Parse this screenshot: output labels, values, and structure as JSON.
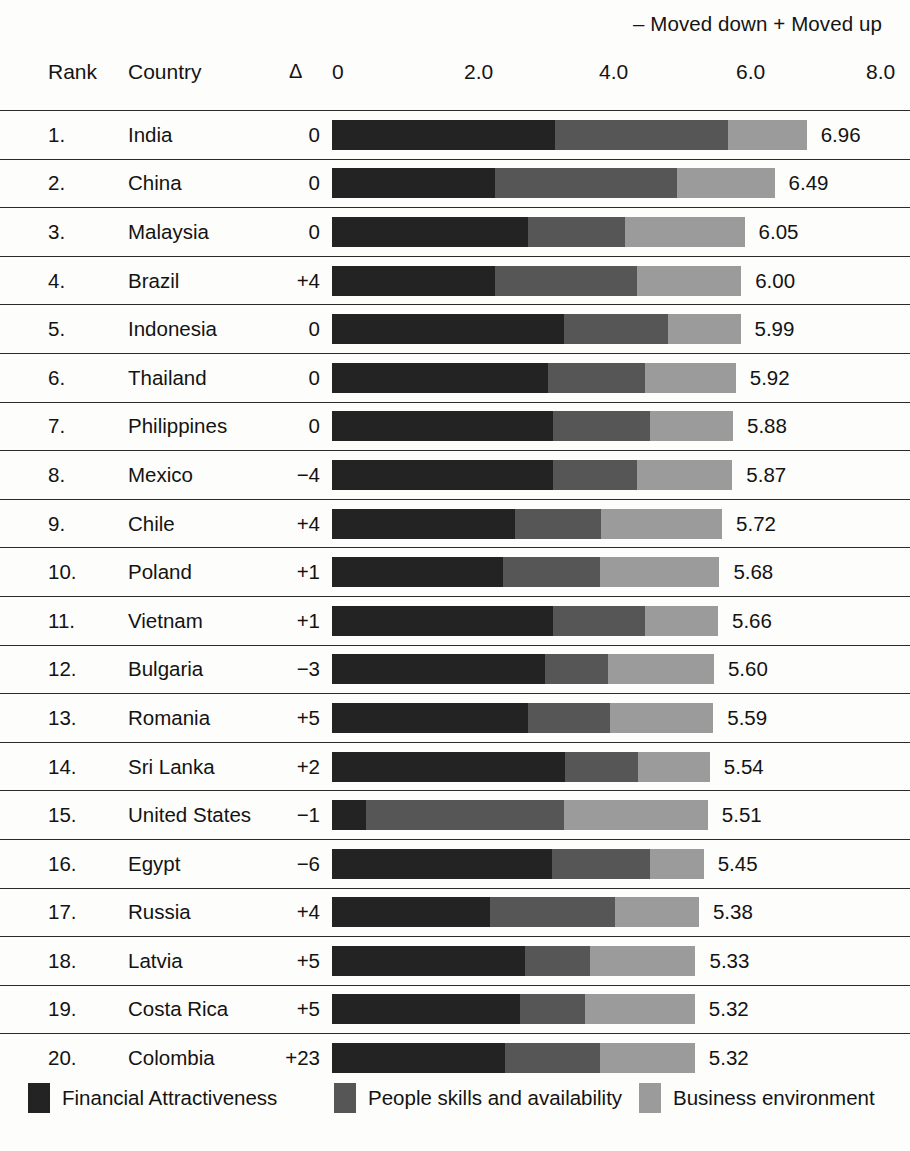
{
  "move_legend": {
    "down_symbol": "–",
    "down_label": "Moved down",
    "up_symbol": "+",
    "up_label": "Moved up",
    "full": "– Moved down + Moved up"
  },
  "columns": {
    "rank": "Rank",
    "country": "Country",
    "delta": "Δ"
  },
  "axis": {
    "ticks": [
      "0",
      "2.0",
      "4.0",
      "6.0",
      "8.0"
    ],
    "min": 0,
    "max": 8,
    "px_per_unit": 68.2,
    "origin_px": 332
  },
  "legend": [
    {
      "label": "Financial Attractiveness",
      "color": "#232323",
      "key": "financial"
    },
    {
      "label": "People skills and availability",
      "color": "#565656",
      "key": "people"
    },
    {
      "label": "Business environment",
      "color": "#9b9b9b",
      "key": "business"
    }
  ],
  "chart_data": {
    "type": "bar",
    "orientation": "horizontal",
    "stacked": true,
    "title": "",
    "xlabel": "",
    "ylabel": "",
    "xlim": [
      0,
      8
    ],
    "xticks": [
      0,
      2,
      4,
      6,
      8
    ],
    "grid": false,
    "legend_position": "bottom",
    "categories": [
      "India",
      "China",
      "Malaysia",
      "Brazil",
      "Indonesia",
      "Thailand",
      "Philippines",
      "Mexico",
      "Chile",
      "Poland",
      "Vietnam",
      "Bulgaria",
      "Romania",
      "Sri Lanka",
      "United States",
      "Egypt",
      "Russia",
      "Latvia",
      "Costa Rica",
      "Colombia"
    ],
    "series": [
      {
        "name": "Financial Attractiveness",
        "color": "#232323",
        "values": [
          3.27,
          2.39,
          2.87,
          2.39,
          3.4,
          3.17,
          3.24,
          3.24,
          2.68,
          2.51,
          3.24,
          3.12,
          2.87,
          3.42,
          0.5,
          3.23,
          2.32,
          2.83,
          2.76,
          2.54
        ]
      },
      {
        "name": "People skills and availability",
        "color": "#565656",
        "values": [
          2.54,
          2.67,
          1.42,
          2.08,
          1.52,
          1.42,
          1.42,
          1.23,
          1.26,
          1.42,
          1.35,
          0.92,
          1.2,
          1.07,
          2.9,
          1.44,
          1.83,
          0.95,
          0.95,
          1.39
        ]
      },
      {
        "name": "Business environment",
        "color": "#9b9b9b",
        "values": [
          1.15,
          1.43,
          1.76,
          1.53,
          1.07,
          1.33,
          1.22,
          1.4,
          1.78,
          1.75,
          1.07,
          1.56,
          1.52,
          1.05,
          2.11,
          0.78,
          1.23,
          1.55,
          1.61,
          1.39
        ]
      }
    ],
    "totals": [
      6.96,
      6.49,
      6.05,
      6.0,
      5.99,
      5.92,
      5.88,
      5.87,
      5.72,
      5.68,
      5.66,
      5.6,
      5.59,
      5.54,
      5.51,
      5.45,
      5.38,
      5.33,
      5.32,
      5.32
    ]
  },
  "rows": [
    {
      "rank": "1.",
      "country": "India",
      "delta": "0",
      "score": "6.96",
      "fin": 3.27,
      "peo": 2.54,
      "biz": 1.15
    },
    {
      "rank": "2.",
      "country": "China",
      "delta": "0",
      "score": "6.49",
      "fin": 2.39,
      "peo": 2.67,
      "biz": 1.43
    },
    {
      "rank": "3.",
      "country": "Malaysia",
      "delta": "0",
      "score": "6.05",
      "fin": 2.87,
      "peo": 1.42,
      "biz": 1.76
    },
    {
      "rank": "4.",
      "country": "Brazil",
      "delta": "+4",
      "score": "6.00",
      "fin": 2.39,
      "peo": 2.08,
      "biz": 1.53
    },
    {
      "rank": "5.",
      "country": "Indonesia",
      "delta": "0",
      "score": "5.99",
      "fin": 3.4,
      "peo": 1.52,
      "biz": 1.07
    },
    {
      "rank": "6.",
      "country": "Thailand",
      "delta": "0",
      "score": "5.92",
      "fin": 3.17,
      "peo": 1.42,
      "biz": 1.33
    },
    {
      "rank": "7.",
      "country": "Philippines",
      "delta": "0",
      "score": "5.88",
      "fin": 3.24,
      "peo": 1.42,
      "biz": 1.22
    },
    {
      "rank": "8.",
      "country": "Mexico",
      "delta": "−4",
      "score": "5.87",
      "fin": 3.24,
      "peo": 1.23,
      "biz": 1.4
    },
    {
      "rank": "9.",
      "country": "Chile",
      "delta": "+4",
      "score": "5.72",
      "fin": 2.68,
      "peo": 1.26,
      "biz": 1.78
    },
    {
      "rank": "10.",
      "country": "Poland",
      "delta": "+1",
      "score": "5.68",
      "fin": 2.51,
      "peo": 1.42,
      "biz": 1.75
    },
    {
      "rank": "11.",
      "country": "Vietnam",
      "delta": "+1",
      "score": "5.66",
      "fin": 3.24,
      "peo": 1.35,
      "biz": 1.07
    },
    {
      "rank": "12.",
      "country": "Bulgaria",
      "delta": "−3",
      "score": "5.60",
      "fin": 3.12,
      "peo": 0.92,
      "biz": 1.56
    },
    {
      "rank": "13.",
      "country": "Romania",
      "delta": "+5",
      "score": "5.59",
      "fin": 2.87,
      "peo": 1.2,
      "biz": 1.52
    },
    {
      "rank": "14.",
      "country": "Sri Lanka",
      "delta": "+2",
      "score": "5.54",
      "fin": 3.42,
      "peo": 1.07,
      "biz": 1.05
    },
    {
      "rank": "15.",
      "country": "United States",
      "delta": "−1",
      "score": "5.51",
      "fin": 0.5,
      "peo": 2.9,
      "biz": 2.11
    },
    {
      "rank": "16.",
      "country": "Egypt",
      "delta": "−6",
      "score": "5.45",
      "fin": 3.23,
      "peo": 1.44,
      "biz": 0.78
    },
    {
      "rank": "17.",
      "country": "Russia",
      "delta": "+4",
      "score": "5.38",
      "fin": 2.32,
      "peo": 1.83,
      "biz": 1.23
    },
    {
      "rank": "18.",
      "country": "Latvia",
      "delta": "+5",
      "score": "5.33",
      "fin": 2.83,
      "peo": 0.95,
      "biz": 1.55
    },
    {
      "rank": "19.",
      "country": "Costa Rica",
      "delta": "+5",
      "score": "5.32",
      "fin": 2.76,
      "peo": 0.95,
      "biz": 1.61
    },
    {
      "rank": "20.",
      "country": "Colombia",
      "delta": "+23",
      "score": "5.32",
      "fin": 2.54,
      "peo": 1.39,
      "biz": 1.39
    }
  ]
}
